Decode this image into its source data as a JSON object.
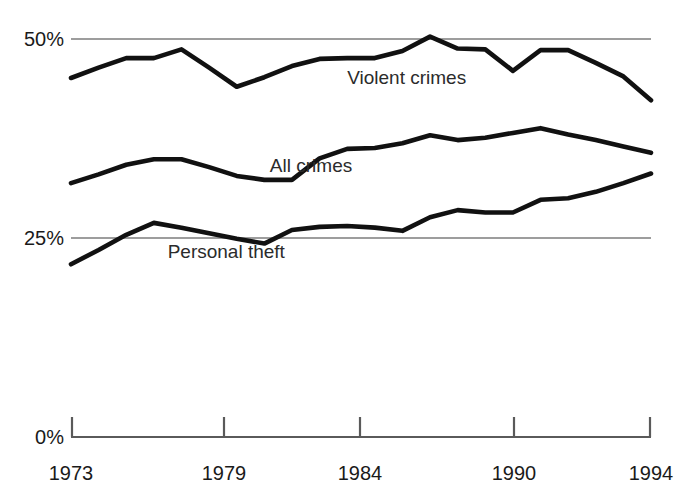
{
  "chart_data": {
    "type": "line",
    "title": "",
    "subtitle": "",
    "xlabel": "",
    "ylabel": "",
    "xlim": [
      1973,
      1994
    ],
    "ylim": [
      0,
      50
    ],
    "grid": "horizontal-gridlines-at-25-and-50",
    "legend_position": "inline-series-labels",
    "y_tick_labels": [
      "50%",
      "25%",
      "0%"
    ],
    "y_tick_values": [
      50,
      25,
      0
    ],
    "x_tick_labels": [
      "1973",
      "1979",
      "1984",
      "1990",
      "1994"
    ],
    "x_tick_values": [
      1973,
      1979,
      1984,
      1990,
      1994
    ],
    "x": [
      1973,
      1974,
      1975,
      1976,
      1977,
      1978,
      1979,
      1980,
      1981,
      1982,
      1983,
      1984,
      1985,
      1986,
      1987,
      1988,
      1989,
      1990,
      1991,
      1992,
      1993,
      1994
    ],
    "series": [
      {
        "name": "Violent crimes",
        "label": "Violent crimes",
        "label_x": 1983.0,
        "label_y": 44.3,
        "values": [
          45.1,
          46.4,
          47.6,
          47.6,
          48.7,
          46.4,
          44.0,
          45.2,
          46.6,
          47.5,
          47.6,
          47.6,
          48.5,
          50.3,
          48.8,
          48.7,
          46.0,
          48.6,
          48.6,
          47.0,
          45.3,
          42.3
        ]
      },
      {
        "name": "All crimes",
        "label": "All crimes",
        "label_x": 1980.2,
        "label_y": 33.3,
        "values": [
          31.9,
          33.0,
          34.2,
          34.9,
          34.9,
          33.9,
          32.8,
          32.3,
          32.3,
          35.0,
          36.2,
          36.3,
          36.9,
          37.9,
          37.3,
          37.6,
          38.2,
          38.8,
          38.0,
          37.3,
          36.5,
          35.7
        ]
      },
      {
        "name": "Personal theft",
        "label": "Personal theft",
        "label_x": 1976.5,
        "label_y": 22.5,
        "values": [
          21.7,
          23.5,
          25.4,
          26.9,
          26.3,
          25.6,
          24.9,
          24.3,
          26.0,
          26.4,
          26.5,
          26.3,
          25.9,
          27.6,
          28.5,
          28.2,
          28.2,
          29.8,
          30.0,
          30.8,
          31.9,
          33.1
        ]
      }
    ]
  }
}
